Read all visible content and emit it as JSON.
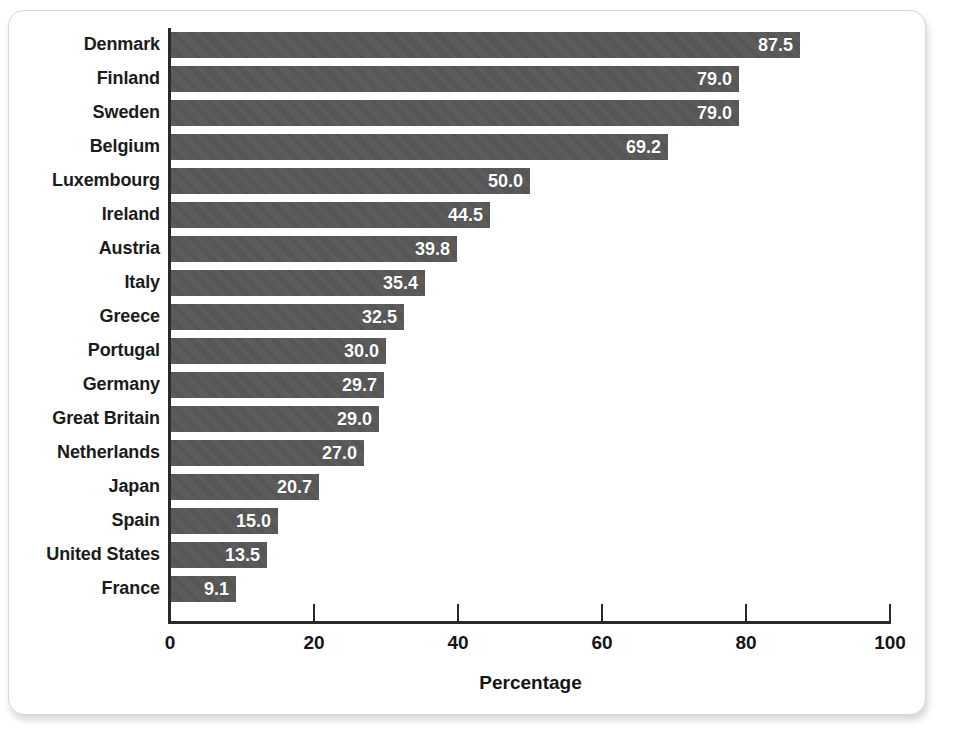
{
  "chart_data": {
    "type": "bar",
    "orientation": "horizontal",
    "title": "",
    "xlabel": "Percentage",
    "ylabel": "",
    "xlim": [
      0,
      100
    ],
    "xticks": [
      0,
      20,
      40,
      60,
      80,
      100
    ],
    "grid": false,
    "legend": null,
    "bar_color": "#555555",
    "value_label_color": "#ffffff",
    "value_label_format": "one-decimal",
    "categories": [
      "Denmark",
      "Finland",
      "Sweden",
      "Belgium",
      "Luxembourg",
      "Ireland",
      "Austria",
      "Italy",
      "Greece",
      "Portugal",
      "Germany",
      "Great Britain",
      "Netherlands",
      "Japan",
      "Spain",
      "United States",
      "France"
    ],
    "values": [
      87.5,
      79.0,
      79.0,
      69.2,
      50.0,
      44.5,
      39.8,
      35.4,
      32.5,
      30.0,
      29.7,
      29.0,
      27.0,
      20.7,
      15.0,
      13.5,
      9.1
    ],
    "value_labels": [
      "87.5",
      "79.0",
      "79.0",
      "69.2",
      "50.0",
      "44.5",
      "39.8",
      "35.4",
      "32.5",
      "30.0",
      "29.7",
      "29.0",
      "27.0",
      "20.7",
      "15.0",
      "13.5",
      "9.1"
    ],
    "xtick_labels": [
      "0",
      "20",
      "40",
      "60",
      "80",
      "100"
    ]
  },
  "card": {
    "background": "#ffffff",
    "border_color": "#d8d8d8"
  }
}
